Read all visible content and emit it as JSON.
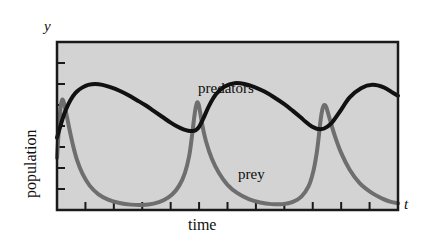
{
  "figure": {
    "background": "#ffffff",
    "plot_fill": "#d3d3d3",
    "frame_color": "#1a1a1a"
  },
  "axes": {
    "y_axis_symbol": "y",
    "x_axis_symbol": "t",
    "y_axis_title": "population",
    "x_axis_title": "time",
    "x_tick_count": 13,
    "y_tick_count": 9
  },
  "series_labels": {
    "predators": "predators",
    "prey": "prey"
  },
  "chart_data": {
    "type": "line",
    "title": "",
    "subtitle": "",
    "xlabel": "time",
    "ylabel": "population",
    "x_axis_symbol": "t",
    "y_axis_symbol": "y",
    "grid": false,
    "legend": "inline-annotations",
    "xlim": [
      0,
      12
    ],
    "ylim": [
      0,
      10
    ],
    "x_tick_values": [
      0,
      1,
      2,
      3,
      4,
      5,
      6,
      7,
      8,
      9,
      10,
      11,
      12
    ],
    "y_tick_values": [
      0,
      1.25,
      2.5,
      3.75,
      5,
      6.25,
      7.5,
      8.75,
      10
    ],
    "annotations": [
      {
        "text": "predators",
        "x": 5.0,
        "y": 7.9
      },
      {
        "text": "prey",
        "x": 6.4,
        "y": 2.6
      }
    ],
    "series": [
      {
        "name": "predators",
        "color": "#111111",
        "linewidth": 4,
        "x": [
          0.0,
          0.12,
          0.25,
          0.4,
          0.55,
          0.7,
          0.9,
          1.1,
          1.35,
          1.6,
          1.9,
          2.2,
          2.5,
          2.8,
          3.1,
          3.4,
          3.7,
          4.0,
          4.25,
          4.45,
          4.62,
          4.75,
          4.88,
          5.0,
          5.15,
          5.35,
          5.6,
          5.9,
          6.25,
          6.6,
          6.95,
          7.3,
          7.65,
          8.0,
          8.3,
          8.55,
          8.75,
          8.92,
          9.05,
          9.2,
          9.4,
          9.65,
          9.95,
          10.3,
          10.7,
          11.1,
          11.5,
          11.8,
          12.0
        ],
        "y": [
          4.3,
          5.0,
          5.7,
          6.3,
          6.75,
          7.05,
          7.3,
          7.45,
          7.5,
          7.45,
          7.3,
          7.1,
          6.85,
          6.55,
          6.25,
          5.9,
          5.55,
          5.2,
          4.95,
          4.8,
          4.72,
          4.7,
          4.75,
          4.95,
          5.45,
          6.2,
          6.9,
          7.35,
          7.55,
          7.5,
          7.32,
          7.05,
          6.7,
          6.3,
          5.9,
          5.55,
          5.25,
          5.02,
          4.9,
          4.82,
          4.85,
          5.15,
          5.85,
          6.7,
          7.25,
          7.45,
          7.3,
          7.0,
          6.8
        ]
      },
      {
        "name": "prey",
        "color": "#6e6e6e",
        "linewidth": 4,
        "x": [
          0.0,
          0.06,
          0.12,
          0.18,
          0.24,
          0.32,
          0.42,
          0.55,
          0.7,
          0.9,
          1.15,
          1.45,
          1.8,
          2.2,
          2.6,
          3.0,
          3.4,
          3.75,
          4.05,
          4.3,
          4.5,
          4.65,
          4.75,
          4.82,
          4.88,
          4.93,
          4.98,
          5.04,
          5.12,
          5.25,
          5.45,
          5.7,
          6.0,
          6.35,
          6.75,
          7.15,
          7.55,
          7.95,
          8.3,
          8.6,
          8.85,
          9.02,
          9.14,
          9.22,
          9.28,
          9.34,
          9.4,
          9.48,
          9.6,
          9.78,
          10.0,
          10.3,
          10.65,
          11.05,
          11.45,
          11.75,
          12.0
        ],
        "y": [
          3.1,
          4.7,
          6.0,
          6.55,
          6.4,
          5.8,
          4.95,
          3.95,
          3.0,
          2.15,
          1.45,
          0.95,
          0.62,
          0.42,
          0.32,
          0.3,
          0.38,
          0.58,
          0.92,
          1.45,
          2.2,
          3.2,
          4.4,
          5.4,
          6.1,
          6.4,
          6.3,
          5.8,
          5.0,
          4.05,
          3.05,
          2.2,
          1.5,
          1.0,
          0.65,
          0.45,
          0.35,
          0.35,
          0.48,
          0.8,
          1.4,
          2.3,
          3.4,
          4.5,
          5.4,
          6.0,
          6.25,
          6.1,
          5.4,
          4.4,
          3.4,
          2.4,
          1.6,
          1.05,
          0.68,
          0.48,
          0.4
        ]
      }
    ]
  }
}
